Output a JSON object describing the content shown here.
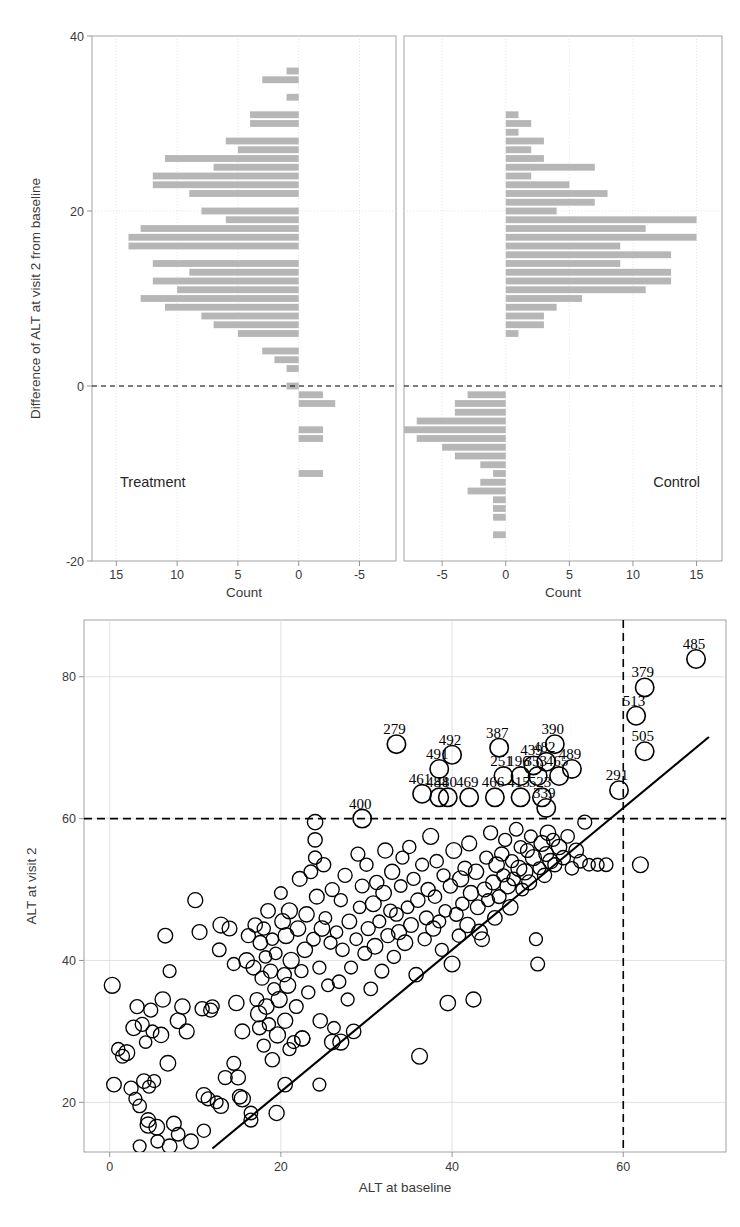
{
  "figure": {
    "background_color": "#ffffff",
    "bar_color": "#b6b6b6",
    "axis_color": "#8a8a8a",
    "grid_color": "#d9d9d9",
    "marker_color": "#000000",
    "reference_line_color": "#000000"
  },
  "chart_data": [
    {
      "type": "bar",
      "id": "treatment-histogram",
      "title": "Treatment",
      "orientation": "horizontal",
      "direction": "left",
      "xlabel": "Count",
      "ylabel": "Difference of ALT at visit 2 from baseline",
      "xlim": [
        17,
        -8
      ],
      "ylim": [
        -20,
        40
      ],
      "xticks": [
        15,
        10,
        5,
        0,
        -5
      ],
      "yticks": [
        40,
        20,
        0,
        -20
      ],
      "grid": true,
      "reference_line_y": 0,
      "bin_width": 1,
      "categories": [
        36,
        35,
        34,
        33,
        32,
        31,
        30,
        29,
        28,
        27,
        26,
        25,
        24,
        23,
        22,
        21,
        20,
        19,
        18,
        17,
        16,
        15,
        14,
        13,
        12,
        11,
        10,
        9,
        8,
        7,
        6,
        5,
        4,
        3,
        2,
        1,
        0,
        -1,
        -2,
        -3,
        -4,
        -5,
        -6,
        -7,
        -8,
        -9,
        -10
      ],
      "values": [
        1,
        3,
        0,
        1,
        0,
        4,
        4,
        0,
        6,
        5,
        11,
        7,
        12,
        12,
        9,
        0,
        8,
        6,
        13,
        14,
        14,
        0,
        12,
        9,
        12,
        10,
        13,
        11,
        8,
        7,
        5,
        0,
        3,
        2,
        1,
        0,
        1,
        -2,
        -3,
        0,
        0,
        -2,
        -2,
        0,
        0,
        0,
        -2
      ]
    },
    {
      "type": "bar",
      "id": "control-histogram",
      "title": "Control",
      "orientation": "horizontal",
      "direction": "right",
      "xlabel": "Count",
      "ylabel": "Difference of ALT at visit 2 from baseline",
      "xlim": [
        -8,
        17
      ],
      "ylim": [
        -20,
        40
      ],
      "xticks": [
        -5,
        0,
        5,
        10,
        15
      ],
      "yticks": [
        40,
        20,
        0,
        -20
      ],
      "grid": true,
      "reference_line_y": 0,
      "bin_width": 1,
      "categories": [
        31,
        30,
        29,
        28,
        27,
        26,
        25,
        24,
        23,
        22,
        21,
        20,
        19,
        18,
        17,
        16,
        15,
        14,
        13,
        12,
        11,
        10,
        9,
        8,
        7,
        6,
        5,
        4,
        3,
        2,
        1,
        0,
        -1,
        -2,
        -3,
        -4,
        -5,
        -6,
        -7,
        -8,
        -9,
        -10,
        -11,
        -12,
        -13,
        -14,
        -15,
        -16,
        -17
      ],
      "values": [
        1,
        2,
        1,
        3,
        2,
        3,
        7,
        2,
        5,
        8,
        7,
        4,
        15,
        11,
        15,
        9,
        13,
        9,
        13,
        13,
        11,
        6,
        4,
        3,
        3,
        1,
        0,
        0,
        0,
        0,
        0,
        0,
        -3,
        -4,
        -4,
        -7,
        -8,
        -7,
        -5,
        -4,
        -2,
        -1,
        -2,
        -3,
        -1,
        -1,
        -1,
        0,
        -1
      ]
    },
    {
      "type": "scatter",
      "id": "alt-scatter",
      "title": "",
      "xlabel": "ALT at baseline",
      "ylabel": "ALT at visit 2",
      "xlim": [
        -3,
        72
      ],
      "ylim": [
        13,
        88
      ],
      "xticks": [
        0,
        20,
        40,
        60
      ],
      "yticks": [
        20,
        40,
        60,
        80
      ],
      "grid": true,
      "reference_lines": [
        {
          "axis": "y",
          "value": 60,
          "style": "dashed"
        },
        {
          "axis": "x",
          "value": 60,
          "style": "dashed"
        }
      ],
      "diagonal_line": {
        "style": "solid",
        "from": [
          12,
          13.5
        ],
        "to": [
          70,
          71.5
        ]
      },
      "marker": "open-circle",
      "labeled_points": [
        {
          "label": "485",
          "x": 68.5,
          "y": 82.5
        },
        {
          "label": "379",
          "x": 62.5,
          "y": 78.5
        },
        {
          "label": "513",
          "x": 61.5,
          "y": 74.5
        },
        {
          "label": "505",
          "x": 62.5,
          "y": 69.5
        },
        {
          "label": "291",
          "x": 59.5,
          "y": 64.0
        },
        {
          "label": "390",
          "x": 52.0,
          "y": 70.5
        },
        {
          "label": "387",
          "x": 45.5,
          "y": 70.0
        },
        {
          "label": "492",
          "x": 40.0,
          "y": 69.0
        },
        {
          "label": "279",
          "x": 33.5,
          "y": 70.5
        },
        {
          "label": "491",
          "x": 38.5,
          "y": 67.0
        },
        {
          "label": "439",
          "x": 49.5,
          "y": 67.5
        },
        {
          "label": "482",
          "x": 51.0,
          "y": 68.0
        },
        {
          "label": "489",
          "x": 54.0,
          "y": 67.0
        },
        {
          "label": "251",
          "x": 46.0,
          "y": 66.0
        },
        {
          "label": "196",
          "x": 48.0,
          "y": 66.0
        },
        {
          "label": "353",
          "x": 50.0,
          "y": 66.0
        },
        {
          "label": "465",
          "x": 52.5,
          "y": 66.0
        },
        {
          "label": "400",
          "x": 29.5,
          "y": 60.0
        },
        {
          "label": "461",
          "x": 36.5,
          "y": 63.5
        },
        {
          "label": "484",
          "x": 38.5,
          "y": 63.0
        },
        {
          "label": "480",
          "x": 39.5,
          "y": 63.0
        },
        {
          "label": "469",
          "x": 42.0,
          "y": 63.0
        },
        {
          "label": "466",
          "x": 45.0,
          "y": 63.0
        },
        {
          "label": "415",
          "x": 48.0,
          "y": 63.0
        },
        {
          "label": "523",
          "x": 50.5,
          "y": 63.0
        },
        {
          "label": "339",
          "x": 51.0,
          "y": 61.5
        }
      ],
      "points": [
        [
          0.3,
          36.5
        ],
        [
          0.5,
          22.5
        ],
        [
          1.0,
          27.5
        ],
        [
          2.0,
          27.0
        ],
        [
          2.5,
          22.0
        ],
        [
          3.0,
          20.5
        ],
        [
          3.2,
          33.5
        ],
        [
          3.5,
          19.5
        ],
        [
          3.8,
          31.0
        ],
        [
          4.0,
          23.0
        ],
        [
          4.2,
          28.5
        ],
        [
          4.5,
          17.5
        ],
        [
          4.6,
          22.2
        ],
        [
          4.8,
          33.0
        ],
        [
          5.0,
          30.0
        ],
        [
          5.2,
          23.0
        ],
        [
          5.5,
          16.5
        ],
        [
          5.6,
          14.5
        ],
        [
          6.0,
          29.5
        ],
        [
          6.2,
          34.5
        ],
        [
          6.5,
          43.5
        ],
        [
          6.8,
          25.5
        ],
        [
          7.0,
          38.5
        ],
        [
          7.5,
          17.0
        ],
        [
          8.0,
          31.5
        ],
        [
          8.5,
          33.5
        ],
        [
          9.0,
          30.0
        ],
        [
          9.5,
          14.5
        ],
        [
          10.0,
          48.5
        ],
        [
          10.5,
          44.0
        ],
        [
          10.8,
          33.2
        ],
        [
          11.0,
          21.0
        ],
        [
          11.5,
          20.5
        ],
        [
          11.8,
          33.0
        ],
        [
          12.0,
          33.5
        ],
        [
          12.5,
          20.0
        ],
        [
          12.8,
          41.5
        ],
        [
          13.0,
          45.0
        ],
        [
          13.5,
          23.5
        ],
        [
          14.0,
          44.5
        ],
        [
          14.5,
          39.5
        ],
        [
          14.8,
          34.0
        ],
        [
          15.0,
          23.5
        ],
        [
          15.2,
          20.8
        ],
        [
          15.5,
          30.0
        ],
        [
          16.0,
          40.0
        ],
        [
          16.2,
          43.5
        ],
        [
          16.5,
          17.5
        ],
        [
          16.8,
          39.0
        ],
        [
          17.0,
          45.0
        ],
        [
          17.2,
          34.5
        ],
        [
          17.4,
          32.5
        ],
        [
          17.5,
          30.5
        ],
        [
          17.6,
          42.5
        ],
        [
          17.8,
          37.5
        ],
        [
          18.0,
          44.5
        ],
        [
          18.2,
          40.5
        ],
        [
          18.3,
          33.5
        ],
        [
          18.5,
          47.0
        ],
        [
          18.6,
          31.0
        ],
        [
          18.8,
          38.5
        ],
        [
          19.0,
          43.0
        ],
        [
          19.2,
          36.0
        ],
        [
          19.4,
          41.0
        ],
        [
          19.5,
          18.5
        ],
        [
          19.6,
          29.5
        ],
        [
          19.8,
          34.5
        ],
        [
          20.0,
          49.5
        ],
        [
          20.2,
          45.5
        ],
        [
          20.4,
          38.0
        ],
        [
          20.5,
          31.5
        ],
        [
          20.6,
          43.5
        ],
        [
          20.8,
          36.5
        ],
        [
          21.0,
          47.0
        ],
        [
          21.2,
          40.0
        ],
        [
          21.5,
          28.5
        ],
        [
          21.8,
          33.5
        ],
        [
          22.0,
          44.5
        ],
        [
          22.2,
          51.5
        ],
        [
          22.4,
          38.5
        ],
        [
          22.5,
          29.0
        ],
        [
          22.8,
          41.5
        ],
        [
          23.0,
          46.5
        ],
        [
          23.2,
          35.5
        ],
        [
          23.5,
          52.5
        ],
        [
          23.8,
          43.0
        ],
        [
          24.0,
          57.0
        ],
        [
          24.0,
          54.5
        ],
        [
          24.0,
          59.5
        ],
        [
          24.2,
          49.0
        ],
        [
          24.5,
          39.0
        ],
        [
          24.6,
          31.5
        ],
        [
          24.8,
          44.5
        ],
        [
          25.0,
          53.5
        ],
        [
          25.2,
          46.0
        ],
        [
          25.5,
          36.5
        ],
        [
          25.8,
          42.5
        ],
        [
          26.0,
          50.0
        ],
        [
          26.2,
          30.5
        ],
        [
          26.5,
          44.0
        ],
        [
          26.8,
          37.0
        ],
        [
          27.0,
          48.5
        ],
        [
          27.2,
          41.5
        ],
        [
          27.5,
          52.0
        ],
        [
          27.8,
          34.5
        ],
        [
          28.0,
          45.5
        ],
        [
          28.2,
          39.0
        ],
        [
          28.5,
          30.0
        ],
        [
          28.8,
          43.0
        ],
        [
          29.0,
          55.0
        ],
        [
          29.2,
          47.5
        ],
        [
          29.5,
          50.5
        ],
        [
          29.8,
          41.0
        ],
        [
          30.0,
          53.5
        ],
        [
          30.2,
          44.5
        ],
        [
          30.5,
          36.0
        ],
        [
          30.8,
          48.0
        ],
        [
          31.0,
          42.0
        ],
        [
          31.2,
          51.0
        ],
        [
          31.5,
          45.5
        ],
        [
          31.8,
          38.5
        ],
        [
          32.0,
          49.5
        ],
        [
          32.2,
          55.5
        ],
        [
          32.5,
          43.5
        ],
        [
          32.8,
          47.0
        ],
        [
          33.0,
          52.5
        ],
        [
          33.2,
          40.5
        ],
        [
          33.5,
          46.5
        ],
        [
          33.8,
          44.0
        ],
        [
          34.0,
          50.5
        ],
        [
          34.2,
          54.5
        ],
        [
          34.5,
          42.5
        ],
        [
          34.8,
          47.5
        ],
        [
          35.0,
          56.0
        ],
        [
          35.2,
          45.0
        ],
        [
          35.5,
          51.5
        ],
        [
          35.8,
          38.0
        ],
        [
          36.0,
          48.5
        ],
        [
          36.2,
          26.5
        ],
        [
          36.5,
          53.5
        ],
        [
          36.8,
          43.0
        ],
        [
          37.0,
          46.0
        ],
        [
          37.2,
          50.0
        ],
        [
          37.5,
          57.5
        ],
        [
          37.8,
          44.5
        ],
        [
          38.0,
          49.0
        ],
        [
          38.2,
          54.0
        ],
        [
          38.5,
          45.5
        ],
        [
          38.8,
          41.5
        ],
        [
          39.0,
          52.0
        ],
        [
          39.2,
          47.0
        ],
        [
          39.5,
          34.0
        ],
        [
          39.8,
          50.5
        ],
        [
          40.0,
          39.5
        ],
        [
          40.2,
          55.5
        ],
        [
          40.5,
          46.5
        ],
        [
          40.8,
          43.5
        ],
        [
          41.0,
          51.5
        ],
        [
          41.2,
          48.0
        ],
        [
          41.5,
          53.0
        ],
        [
          41.8,
          45.0
        ],
        [
          42.0,
          56.5
        ],
        [
          42.2,
          49.5
        ],
        [
          42.5,
          34.5
        ],
        [
          42.8,
          52.5
        ],
        [
          43.0,
          47.5
        ],
        [
          43.2,
          44.0
        ],
        [
          43.5,
          43.0
        ],
        [
          43.8,
          50.0
        ],
        [
          44.0,
          54.5
        ],
        [
          44.2,
          48.5
        ],
        [
          44.5,
          58.0
        ],
        [
          44.8,
          51.0
        ],
        [
          45.0,
          46.0
        ],
        [
          45.2,
          53.5
        ],
        [
          45.5,
          49.0
        ],
        [
          45.8,
          55.0
        ],
        [
          46.0,
          52.0
        ],
        [
          46.2,
          57.0
        ],
        [
          46.5,
          50.5
        ],
        [
          46.8,
          47.5
        ],
        [
          47.0,
          54.0
        ],
        [
          47.2,
          51.5
        ],
        [
          47.5,
          58.5
        ],
        [
          47.8,
          53.0
        ],
        [
          48.0,
          56.0
        ],
        [
          48.2,
          50.0
        ],
        [
          48.5,
          52.5
        ],
        [
          48.8,
          55.5
        ],
        [
          49.0,
          51.0
        ],
        [
          49.2,
          57.5
        ],
        [
          49.5,
          54.5
        ],
        [
          49.8,
          43.0
        ],
        [
          50.0,
          39.5
        ],
        [
          50.2,
          53.0
        ],
        [
          50.5,
          56.5
        ],
        [
          50.8,
          52.0
        ],
        [
          51.0,
          55.0
        ],
        [
          51.2,
          58.0
        ],
        [
          51.5,
          54.0
        ],
        [
          51.8,
          57.0
        ],
        [
          52.0,
          53.5
        ],
        [
          52.5,
          56.0
        ],
        [
          53.0,
          54.5
        ],
        [
          53.5,
          57.5
        ],
        [
          54.0,
          53.0
        ],
        [
          54.5,
          55.5
        ],
        [
          55.0,
          54.0
        ],
        [
          55.5,
          59.5
        ],
        [
          56.0,
          53.5
        ],
        [
          57.0,
          53.5
        ],
        [
          58.0,
          53.5
        ],
        [
          62.0,
          53.5
        ],
        [
          15.5,
          20.5
        ],
        [
          16.5,
          18.5
        ],
        [
          13.0,
          19.5
        ],
        [
          11.0,
          16.0
        ],
        [
          8.0,
          15.5
        ],
        [
          7.0,
          13.8
        ],
        [
          3.5,
          13.8
        ],
        [
          4.5,
          16.8
        ],
        [
          20.5,
          22.5
        ],
        [
          24.5,
          22.5
        ],
        [
          21.0,
          27.5
        ],
        [
          22.5,
          29.0
        ],
        [
          26.0,
          28.5
        ],
        [
          27.0,
          28.5
        ],
        [
          18.0,
          28.0
        ],
        [
          19.0,
          26.0
        ],
        [
          14.5,
          25.5
        ],
        [
          2.8,
          30.5
        ],
        [
          1.5,
          26.5
        ]
      ]
    }
  ],
  "panels": {
    "top_left": {
      "label": "Treatment",
      "axis_title_x": "Count",
      "x_tick_labels": [
        "15",
        "10",
        "5",
        "0",
        "-5"
      ]
    },
    "top_right": {
      "label": "Control",
      "axis_title_x": "Count",
      "x_tick_labels": [
        "-5",
        "0",
        "5",
        "10",
        "15"
      ]
    },
    "shared_y": {
      "axis_title": "Difference of ALT at visit 2 from baseline",
      "y_tick_labels": [
        "40",
        "20",
        "0",
        "-20"
      ]
    },
    "bottom": {
      "axis_title_x": "ALT at baseline",
      "axis_title_y": "ALT at visit 2",
      "x_tick_labels": [
        "0",
        "20",
        "40",
        "60"
      ],
      "y_tick_labels": [
        "20",
        "40",
        "60",
        "80"
      ]
    }
  }
}
